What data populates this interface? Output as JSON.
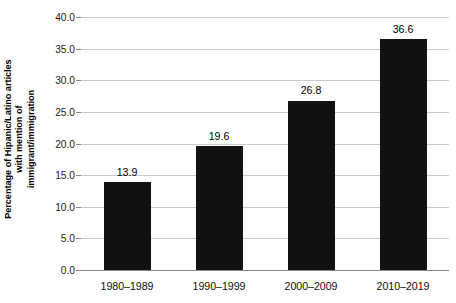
{
  "chart_data": {
    "type": "bar",
    "title": "",
    "subtitle": "",
    "xlabel": "",
    "ylabel": "Percentage of Hipanic/Latino articles with mention of immigrant/immigration",
    "ylabel_lines": [
      "Percentage of Hipanic/Latino articles",
      "with mention of",
      "immigrant/immigration"
    ],
    "categories": [
      "1980–1989",
      "1990–1999",
      "2000–2009",
      "2010–2019"
    ],
    "values": [
      13.9,
      19.6,
      26.8,
      36.6
    ],
    "value_labels": [
      "13.9",
      "19.6",
      "26.8",
      "36.6"
    ],
    "ylim": [
      0.0,
      40.0
    ],
    "ytick_values": [
      0.0,
      5.0,
      10.0,
      15.0,
      20.0,
      25.0,
      30.0,
      35.0,
      40.0
    ],
    "ytick_labels": [
      "0.0",
      "5.0",
      "10.0",
      "15.0",
      "20.0",
      "25.0",
      "30.0",
      "35.0",
      "40.0"
    ],
    "grid": true,
    "grid_axis": "y",
    "legend": false,
    "legend_position": "none",
    "bar_color": "#111111",
    "grid_color": "#c9c9c9",
    "axis_color": "#8a8a8a",
    "background_color": "#ffffff",
    "text_color": "#000000"
  }
}
